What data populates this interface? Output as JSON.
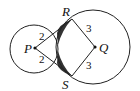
{
  "diagram": {
    "points": {
      "P": "P",
      "Q": "Q",
      "R": "R",
      "S": "S"
    },
    "segments": {
      "PR": "2",
      "PS": "2",
      "QR": "3",
      "QS": "3"
    },
    "circles": [
      {
        "center": "P",
        "radius": 2
      },
      {
        "center": "Q",
        "radius": 3
      }
    ],
    "shaded_region": "region between circles bounded by tangents near R and S",
    "colors": {
      "stroke": "#222222",
      "shade": "#333333"
    }
  }
}
